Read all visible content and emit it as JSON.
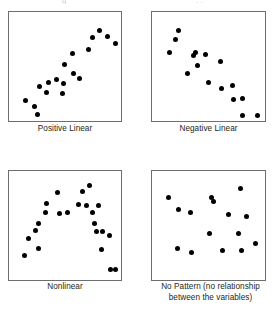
{
  "figure": {
    "width": 276,
    "height": 310,
    "background_color": "#ffffff",
    "dot_color": "#000000",
    "box_border_color": "#6d6e71",
    "caption_color": "#231f20",
    "clipped_top_text_left": "g",
    "clipped_top_text_right": ". ."
  },
  "chart_data": [
    {
      "type": "scatter",
      "title": "Positive Linear",
      "xlabel": "",
      "ylabel": "",
      "xlim": [
        0,
        100
      ],
      "ylim": [
        0,
        100
      ],
      "grid": false,
      "legend": "none",
      "panel_index": 0,
      "box": {
        "x": 8,
        "y": 11,
        "width": 114,
        "height": 111
      },
      "caption_box": {
        "x": 8,
        "y": 124,
        "width": 114
      },
      "points": [
        {
          "x": 10,
          "y": 17
        },
        {
          "x": 19,
          "y": 11
        },
        {
          "x": 22,
          "y": 3
        },
        {
          "x": 24,
          "y": 31
        },
        {
          "x": 31,
          "y": 25
        },
        {
          "x": 33,
          "y": 35
        },
        {
          "x": 41,
          "y": 38
        },
        {
          "x": 47,
          "y": 24
        },
        {
          "x": 48,
          "y": 34
        },
        {
          "x": 49,
          "y": 53
        },
        {
          "x": 56,
          "y": 64
        },
        {
          "x": 57,
          "y": 44
        },
        {
          "x": 63,
          "y": 39
        },
        {
          "x": 72,
          "y": 68
        },
        {
          "x": 76,
          "y": 80
        },
        {
          "x": 83,
          "y": 87
        },
        {
          "x": 91,
          "y": 81
        },
        {
          "x": 99,
          "y": 74
        }
      ]
    },
    {
      "type": "scatter",
      "title": "Negative Linear",
      "xlabel": "",
      "ylabel": "",
      "xlim": [
        0,
        100
      ],
      "ylim": [
        0,
        100
      ],
      "grid": false,
      "legend": "none",
      "panel_index": 1,
      "box": {
        "x": 151,
        "y": 11,
        "width": 115,
        "height": 111
      },
      "caption_box": {
        "x": 151,
        "y": 124,
        "width": 115
      },
      "points": [
        {
          "x": 11,
          "y": 65
        },
        {
          "x": 17,
          "y": 78
        },
        {
          "x": 20,
          "y": 87
        },
        {
          "x": 29,
          "y": 44
        },
        {
          "x": 34,
          "y": 62
        },
        {
          "x": 36,
          "y": 65
        },
        {
          "x": 38,
          "y": 52
        },
        {
          "x": 46,
          "y": 63
        },
        {
          "x": 49,
          "y": 35
        },
        {
          "x": 61,
          "y": 56
        },
        {
          "x": 62,
          "y": 29
        },
        {
          "x": 72,
          "y": 32
        },
        {
          "x": 73,
          "y": 18
        },
        {
          "x": 82,
          "y": 19
        },
        {
          "x": 82,
          "y": 2
        },
        {
          "x": 97,
          "y": 2
        }
      ]
    },
    {
      "type": "scatter",
      "title": "Nonlinear",
      "xlabel": "",
      "ylabel": "",
      "xlim": [
        0,
        100
      ],
      "ylim": [
        0,
        100
      ],
      "grid": false,
      "legend": "none",
      "panel_index": 2,
      "box": {
        "x": 8,
        "y": 170,
        "width": 114,
        "height": 111
      },
      "caption_box": {
        "x": 8,
        "y": 282,
        "width": 114
      },
      "points": [
        {
          "x": 9,
          "y": 21
        },
        {
          "x": 13,
          "y": 38
        },
        {
          "x": 20,
          "y": 46
        },
        {
          "x": 23,
          "y": 53
        },
        {
          "x": 23,
          "y": 28
        },
        {
          "x": 30,
          "y": 64
        },
        {
          "x": 31,
          "y": 73
        },
        {
          "x": 42,
          "y": 84
        },
        {
          "x": 44,
          "y": 63
        },
        {
          "x": 51,
          "y": 64
        },
        {
          "x": 62,
          "y": 72
        },
        {
          "x": 66,
          "y": 85
        },
        {
          "x": 70,
          "y": 71
        },
        {
          "x": 73,
          "y": 91
        },
        {
          "x": 76,
          "y": 64
        },
        {
          "x": 78,
          "y": 53
        },
        {
          "x": 80,
          "y": 45
        },
        {
          "x": 82,
          "y": 71
        },
        {
          "x": 85,
          "y": 27
        },
        {
          "x": 86,
          "y": 45
        },
        {
          "x": 93,
          "y": 41
        },
        {
          "x": 94,
          "y": 7
        },
        {
          "x": 99,
          "y": 7
        }
      ]
    },
    {
      "type": "scatter",
      "title": "No Pattern (no relationship\nbetween the variables)",
      "xlabel": "",
      "ylabel": "",
      "xlim": [
        0,
        100
      ],
      "ylim": [
        0,
        100
      ],
      "grid": false,
      "legend": "none",
      "panel_index": 3,
      "box": {
        "x": 151,
        "y": 170,
        "width": 115,
        "height": 111
      },
      "caption_box": {
        "x": 145,
        "y": 282,
        "width": 131
      },
      "points": [
        {
          "x": 10,
          "y": 79
        },
        {
          "x": 20,
          "y": 67
        },
        {
          "x": 19,
          "y": 28
        },
        {
          "x": 32,
          "y": 64
        },
        {
          "x": 33,
          "y": 24
        },
        {
          "x": 52,
          "y": 79
        },
        {
          "x": 50,
          "y": 43
        },
        {
          "x": 63,
          "y": 26
        },
        {
          "x": 54,
          "y": 75
        },
        {
          "x": 68,
          "y": 62
        },
        {
          "x": 78,
          "y": 43
        },
        {
          "x": 81,
          "y": 26
        },
        {
          "x": 80,
          "y": 88
        },
        {
          "x": 86,
          "y": 60
        },
        {
          "x": 95,
          "y": 33
        }
      ]
    }
  ]
}
